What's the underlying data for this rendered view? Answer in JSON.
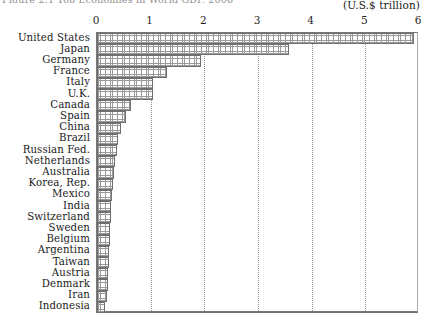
{
  "figure": {
    "caption_clipped": "Figure 2.1  Top Economies in World GDP, 2006",
    "unit_label": "(U.S.$ trillion)"
  },
  "chart_data": {
    "type": "bar",
    "orientation": "horizontal",
    "title": "Figure 2.1  Top Economies in World GDP, 2006",
    "xlabel": "(U.S.$ trillion)",
    "ylabel": "",
    "xlim": [
      0,
      6
    ],
    "xticks": [
      0,
      1,
      2,
      3,
      4,
      5,
      6
    ],
    "xtick_labels": [
      "0",
      "1",
      "2",
      "3",
      "4",
      "5",
      "6"
    ],
    "grid": true,
    "grid_axis": "x",
    "grid_style": "dotted",
    "legend": false,
    "categories": [
      "United States",
      "Japan",
      "Germany",
      "France",
      "Italy",
      "U.K.",
      "Canada",
      "Spain",
      "China",
      "Brazil",
      "Russian Fed.",
      "Netherlands",
      "Australia",
      "Korea, Rep.",
      "Mexico",
      "India",
      "Switzerland",
      "Sweden",
      "Belgium",
      "Argentina",
      "Taiwan",
      "Austria",
      "Denmark",
      "Iran",
      "Indonesia"
    ],
    "values": [
      5.9,
      3.58,
      1.94,
      1.3,
      1.04,
      1.04,
      0.64,
      0.54,
      0.44,
      0.4,
      0.37,
      0.33,
      0.31,
      0.29,
      0.28,
      0.27,
      0.26,
      0.25,
      0.24,
      0.23,
      0.22,
      0.21,
      0.2,
      0.18,
      0.15
    ],
    "bar_fill": "cross-hatch",
    "bar_edge_color": "#6f6f6f"
  },
  "colors": {
    "axis": "#6f6f6f",
    "grid": "#909090",
    "text": "#1b1b1b",
    "bar_edge": "#6f6f6f",
    "bar_face": "#fdfdfd"
  }
}
